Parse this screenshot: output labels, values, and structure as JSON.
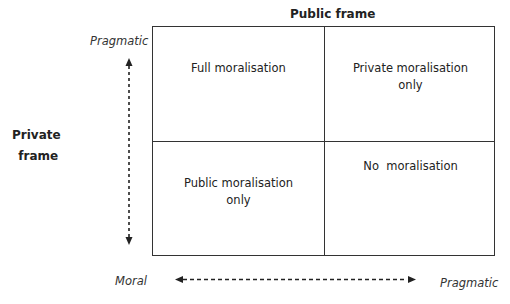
{
  "diagram": {
    "top_title": "Public frame",
    "left_title_line1": "Private",
    "left_title_line2": "frame",
    "y_axis": {
      "top_label": "Pragmatic",
      "bottom_label": ""
    },
    "x_axis": {
      "left_label": "Moral",
      "right_label": "Pragmatic"
    },
    "cells": {
      "top_left": {
        "line1": "Full moralisation",
        "line2": ""
      },
      "top_right": {
        "line1": "Private moralisation",
        "line2": "only"
      },
      "bottom_left": {
        "line1": "Public moralisation",
        "line2": "only"
      },
      "bottom_right": {
        "line1": "No  moralisation",
        "line2": ""
      }
    }
  }
}
